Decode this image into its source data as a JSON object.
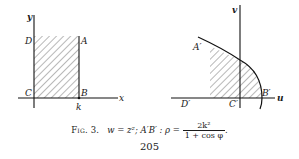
{
  "figure": {
    "number_label": "Fig. 3.",
    "left_panel": {
      "axes": {
        "horizontal": "x",
        "vertical": "y"
      },
      "points": {
        "A": "A",
        "B": "B",
        "C": "C",
        "D": "D"
      },
      "tick_label": "k",
      "region": "rectangle ABCD (hatched)"
    },
    "right_panel": {
      "axes": {
        "horizontal": "u",
        "vertical": "v"
      },
      "points": {
        "A": "A′",
        "B": "B′",
        "C": "C′",
        "D": "D′"
      },
      "region": "parabolic region (hatched)"
    },
    "caption": {
      "mapping": "w = z²;",
      "curve_label": "A′B′ : ρ =",
      "fraction_numerator": "2k²",
      "fraction_denominator": "1 + cos φ",
      "end": "."
    }
  },
  "page": {
    "number": "205"
  }
}
